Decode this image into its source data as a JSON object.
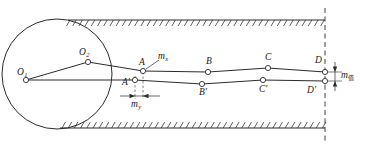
{
  "figure": {
    "type": "mechanism-kinematic-diagram",
    "title": "",
    "stroke_color": "#2b2b2b",
    "node_fill": "#ffffff",
    "background": "#ffffff"
  },
  "labels": {
    "o1": {
      "text": "O",
      "sub": "1",
      "x": 17,
      "y": 68
    },
    "o2": {
      "text": "O",
      "sub": "2",
      "x": 79,
      "y": 48
    },
    "a": {
      "text": "A",
      "sub": "",
      "x": 139,
      "y": 58
    },
    "a_prime": {
      "text": "A",
      "sub": "",
      "prime": "′",
      "x": 122,
      "y": 78
    },
    "b": {
      "text": "B",
      "sub": "",
      "x": 206,
      "y": 57
    },
    "b_prime": {
      "text": "B",
      "sub": "",
      "prime": "′",
      "x": 199,
      "y": 92
    },
    "c": {
      "text": "C",
      "sub": "",
      "x": 265,
      "y": 53
    },
    "c_prime": {
      "text": "C",
      "sub": "",
      "prime": "′",
      "x": 259,
      "y": 91
    },
    "d": {
      "text": "D",
      "sub": "",
      "x": 315,
      "y": 56
    },
    "d_prime": {
      "text": "D",
      "sub": "",
      "prime": "′",
      "x": 307,
      "y": 92
    },
    "mx": {
      "text": "m",
      "sub": "x",
      "x": 155,
      "y": 55
    },
    "my": {
      "text": "m",
      "sub": "y",
      "x": 131,
      "y": 100
    },
    "m_val": {
      "text": "m",
      "sub": "值",
      "x": 339,
      "y": 73
    }
  },
  "nodes": [
    {
      "name": "O1",
      "x": 26,
      "y": 80
    },
    {
      "name": "O2",
      "x": 88,
      "y": 62
    },
    {
      "name": "A",
      "x": 143,
      "y": 71
    },
    {
      "name": "A-prime",
      "x": 135,
      "y": 80
    },
    {
      "name": "B",
      "x": 208,
      "y": 72
    },
    {
      "name": "B-prime",
      "x": 202,
      "y": 84
    },
    {
      "name": "C",
      "x": 268,
      "y": 68
    },
    {
      "name": "C-prime",
      "x": 263,
      "y": 80
    },
    {
      "name": "D",
      "x": 325,
      "y": 72
    },
    {
      "name": "D-prime",
      "x": 325,
      "y": 81
    }
  ],
  "links": {
    "upper_chain": [
      "O1",
      "O2",
      "A",
      "B",
      "C",
      "D"
    ],
    "lower_chain": [
      "O1",
      "A-prime",
      "B-prime",
      "C-prime",
      "D-prime"
    ]
  },
  "crank_circle": {
    "cx": 57,
    "cy": 74,
    "r": 55
  },
  "walls": {
    "top": {
      "y": 20,
      "x_start": 68,
      "x_end": 325
    },
    "bottom": {
      "y": 128,
      "x_start": 60,
      "x_end": 325
    },
    "hatch_length": 6,
    "hatch_spacing": 6.2
  },
  "reference_line": {
    "x": 325,
    "y_top": 8,
    "y_bottom": 143,
    "style": "dashed"
  },
  "dimensions": {
    "my": {
      "label": "m_y",
      "axis": "horizontal",
      "y": 96,
      "x_start": 135,
      "x_end": 143,
      "extension_top": 72
    },
    "m_val": {
      "label": "m_值",
      "axis": "vertical",
      "x": 335,
      "y_start": 72,
      "y_end": 81
    }
  }
}
